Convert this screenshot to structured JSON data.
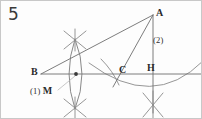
{
  "figure": {
    "number": "5",
    "type": "geometric-construction",
    "background_color": "#fdfdfd",
    "line_color": "#6e6e6e",
    "label_color": "#2b2b2b"
  },
  "points": {
    "a": {
      "label": "A",
      "x": 152,
      "y": 14
    },
    "b": {
      "label": "B",
      "x": 40,
      "y": 73
    },
    "c": {
      "label": "C",
      "x": 122,
      "y": 73
    },
    "h": {
      "label": "H",
      "x": 152,
      "y": 73
    },
    "m": {
      "label": "M",
      "x": 76,
      "y": 73
    }
  },
  "steps": {
    "one": "(1)",
    "one_point": "M",
    "two": "(2)"
  },
  "geometry": {
    "baseline": {
      "x1": 40,
      "y1": 73,
      "x2": 202,
      "y2": 73
    },
    "line_b_to_a": {
      "x1": 40,
      "y1": 73,
      "x2": 152,
      "y2": 14
    },
    "line_a_to_c": {
      "x1": 152,
      "y1": 14,
      "x2": 112,
      "y2": 84
    },
    "line_a_to_h": {
      "x1": 152,
      "y1": 14,
      "x2": 152,
      "y2": 110
    },
    "leader_line": {
      "x1": 58,
      "y1": 88,
      "x2": 74,
      "y2": 74
    }
  }
}
